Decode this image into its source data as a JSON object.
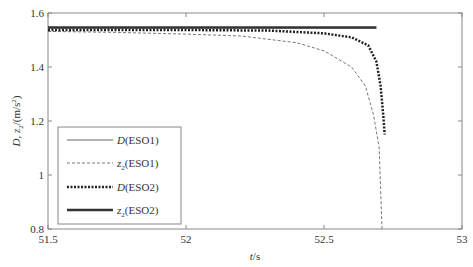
{
  "chart_data": {
    "type": "line",
    "title": "",
    "xlabel": "t/s",
    "ylabel": "D, z2/(m/s²)",
    "xlim": [
      51.5,
      53
    ],
    "ylim": [
      0.8,
      1.6
    ],
    "xticks": [
      51.5,
      52,
      52.5,
      53
    ],
    "xtick_labels": [
      "51.5",
      "52",
      "52.5",
      "53"
    ],
    "yticks": [
      0.8,
      1.0,
      1.2,
      1.4,
      1.6
    ],
    "ytick_labels": [
      "0.8",
      "1",
      "1.2",
      "1.4",
      "1.6"
    ],
    "grid": false,
    "legend_position": "lower left",
    "series": [
      {
        "name": "D(ESO1)",
        "style": "thin-solid",
        "color": "#666666",
        "x": [
          51.5,
          52.0,
          52.5,
          52.69
        ],
        "y": [
          1.545,
          1.545,
          1.545,
          1.545
        ]
      },
      {
        "name": "z2(ESO1)",
        "style": "thin-dashed",
        "color": "#777777",
        "x": [
          51.5,
          51.75,
          52.0,
          52.2,
          52.4,
          52.5,
          52.6,
          52.65,
          52.68,
          52.7,
          52.705,
          52.71
        ],
        "y": [
          1.532,
          1.528,
          1.522,
          1.515,
          1.49,
          1.46,
          1.4,
          1.33,
          1.22,
          1.1,
          0.95,
          0.8
        ]
      },
      {
        "name": "D(ESO2)",
        "style": "thick-dotted",
        "color": "#222222",
        "x": [
          51.5,
          52.0,
          52.3,
          52.5,
          52.6,
          52.66,
          52.69,
          52.705,
          52.715,
          52.72
        ],
        "y": [
          1.537,
          1.537,
          1.535,
          1.525,
          1.51,
          1.48,
          1.42,
          1.33,
          1.22,
          1.15
        ]
      },
      {
        "name": "z2(ESO2)",
        "style": "thick-solid",
        "color": "#333333",
        "x": [
          51.5,
          52.0,
          52.5,
          52.69
        ],
        "y": [
          1.546,
          1.546,
          1.546,
          1.546
        ]
      }
    ]
  },
  "legend": {
    "items": [
      {
        "sym": "D",
        "rest": "(ESO1)"
      },
      {
        "sym": "z",
        "sub": "2",
        "rest": "(ESO1)"
      },
      {
        "sym": "D",
        "rest": "(ESO2)"
      },
      {
        "sym": "z",
        "sub": "2",
        "rest": "(ESO2)"
      }
    ]
  },
  "axes": {
    "xlabel_italic": "t",
    "xlabel_rest": "/s",
    "ylabel_D": "D",
    "ylabel_sep": ", ",
    "ylabel_z": "z",
    "ylabel_sub": "2",
    "ylabel_unit_pre": "/(m/s",
    "ylabel_sup": "2",
    "ylabel_unit_post": ")"
  }
}
